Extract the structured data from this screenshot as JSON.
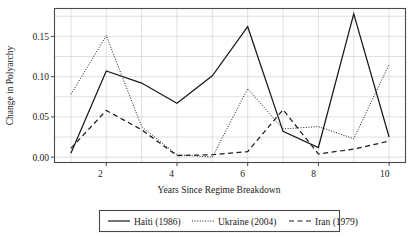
{
  "chart_data": {
    "type": "line",
    "title": "",
    "xlabel": "Years Since Regime Breakdown",
    "ylabel": "Change in Polyarchy",
    "x": [
      1,
      2,
      3,
      4,
      5,
      6,
      7,
      8,
      9,
      10
    ],
    "xlim": [
      0.55,
      10.45
    ],
    "ylim": [
      -0.006,
      0.184
    ],
    "xticks": [
      2,
      4,
      6,
      8,
      10
    ],
    "xtick_labels": [
      "2",
      "4",
      "6",
      "8",
      "10"
    ],
    "yticks": [
      0.0,
      0.05,
      0.1,
      0.15
    ],
    "ytick_labels": [
      "0.00",
      "0.05",
      "0.10",
      "0.15"
    ],
    "grid": true,
    "grid_minor_y": [
      0.025,
      0.075,
      0.125,
      0.175
    ],
    "legend_position": "below",
    "series": [
      {
        "name": "Haiti (1986)",
        "style": "solid",
        "color": "#1a1a1a",
        "values": [
          0.005,
          0.107,
          0.092,
          0.067,
          0.101,
          0.162,
          0.032,
          0.012,
          0.178,
          0.025
        ]
      },
      {
        "name": "Ukraine (2004)",
        "style": "dotted",
        "color": "#1a1a1a",
        "values": [
          0.078,
          0.151,
          0.038,
          0.003,
          0.0,
          0.085,
          0.035,
          0.038,
          0.023,
          0.115
        ]
      },
      {
        "name": "Iran (1979)",
        "style": "dashed",
        "color": "#1a1a1a",
        "values": [
          0.011,
          0.058,
          0.034,
          0.002,
          0.003,
          0.007,
          0.059,
          0.004,
          0.01,
          0.02
        ]
      }
    ]
  },
  "axes": {
    "y_title": "Change in Polyarchy",
    "x_title": "Years Since Regime Breakdown",
    "ytick_0": "0.00",
    "ytick_1": "0.05",
    "ytick_2": "0.10",
    "ytick_3": "0.15",
    "xtick_0": "2",
    "xtick_1": "4",
    "xtick_2": "6",
    "xtick_3": "8",
    "xtick_4": "10"
  },
  "legend": {
    "items": [
      {
        "label": "Haiti (1986)",
        "style": "solid"
      },
      {
        "label": "Ukraine (2004)",
        "style": "dotted"
      },
      {
        "label": "Iran (1979)",
        "style": "dashed"
      }
    ]
  }
}
